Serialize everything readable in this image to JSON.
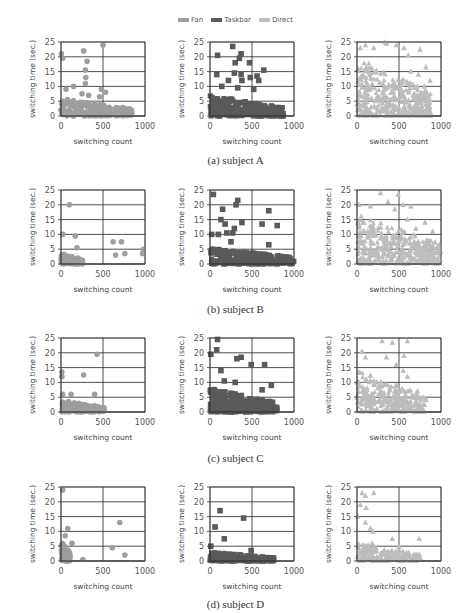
{
  "legend": [
    {
      "name": "Fan",
      "color": "#9e9e9e",
      "marker": "circle"
    },
    {
      "name": "Taskbar",
      "color": "#5a5a5a",
      "marker": "square"
    },
    {
      "name": "Direct",
      "color": "#bdbdbd",
      "marker": "triangle"
    }
  ],
  "captions": [
    "(a) subject A",
    "(b) subject B",
    "(c) subject C",
    "(d) subject D"
  ],
  "chart_data": [
    {
      "type": "scatter",
      "subject": "A",
      "series": "Fan",
      "marker": "circle",
      "color": "#9e9e9e",
      "xlabel": "switching count",
      "ylabel": "switching time (sec.)",
      "xlim": [
        0,
        1000
      ],
      "ylim": [
        0,
        25
      ],
      "xticks": [
        0,
        500,
        1000
      ],
      "yticks": [
        0,
        5,
        10,
        15,
        20,
        25
      ],
      "grid": true,
      "outliers": [
        [
          5,
          21
        ],
        [
          20,
          19.5
        ],
        [
          500,
          24
        ],
        [
          270,
          22
        ],
        [
          310,
          18.5
        ],
        [
          290,
          15.5
        ],
        [
          295,
          13
        ],
        [
          290,
          11
        ],
        [
          150,
          10
        ],
        [
          60,
          9
        ],
        [
          480,
          9
        ],
        [
          530,
          8
        ],
        [
          250,
          7.5
        ],
        [
          330,
          7
        ],
        [
          460,
          6.5
        ],
        [
          20,
          5
        ]
      ],
      "dense_region": {
        "x_range": [
          0,
          870
        ],
        "y_range": [
          0,
          6
        ]
      }
    },
    {
      "type": "scatter",
      "subject": "A",
      "series": "Taskbar",
      "marker": "square",
      "color": "#5a5a5a",
      "xlabel": "switching count",
      "ylabel": "switching time (sec.)",
      "xlim": [
        0,
        1000
      ],
      "ylim": [
        0,
        25
      ],
      "xticks": [
        0,
        500,
        1000
      ],
      "yticks": [
        0,
        5,
        10,
        15,
        20,
        25
      ],
      "grid": true,
      "outliers": [
        [
          270,
          23.5
        ],
        [
          90,
          20.5
        ],
        [
          370,
          21
        ],
        [
          350,
          19.5
        ],
        [
          300,
          18
        ],
        [
          470,
          18
        ],
        [
          640,
          15.5
        ],
        [
          80,
          14
        ],
        [
          290,
          14.5
        ],
        [
          370,
          14
        ],
        [
          560,
          13.5
        ],
        [
          480,
          13
        ],
        [
          380,
          12
        ],
        [
          580,
          12
        ],
        [
          220,
          12
        ],
        [
          330,
          9.5
        ],
        [
          520,
          9
        ],
        [
          140,
          10
        ]
      ],
      "dense_region": {
        "x_range": [
          0,
          880
        ],
        "y_range": [
          0,
          7
        ]
      }
    },
    {
      "type": "scatter",
      "subject": "A",
      "series": "Direct",
      "marker": "triangle",
      "color": "#bdbdbd",
      "xlabel": "switching count",
      "ylabel": "switching time (sec.)",
      "xlim": [
        0,
        1000
      ],
      "ylim": [
        0,
        25
      ],
      "xticks": [
        0,
        500,
        1000
      ],
      "yticks": [
        0,
        5,
        10,
        15,
        20,
        25
      ],
      "grid": true,
      "outliers": [
        [
          40,
          23
        ],
        [
          100,
          24
        ],
        [
          200,
          23
        ],
        [
          330,
          25
        ],
        [
          350,
          24.5
        ],
        [
          470,
          24
        ],
        [
          560,
          23
        ],
        [
          750,
          22.5
        ],
        [
          610,
          20.5
        ],
        [
          820,
          16.5
        ],
        [
          870,
          12
        ],
        [
          640,
          15
        ],
        [
          730,
          14
        ],
        [
          800,
          10
        ],
        [
          700,
          7
        ]
      ],
      "dense_region": {
        "x_range": [
          0,
          880
        ],
        "y_range": [
          0,
          20
        ]
      }
    },
    {
      "type": "scatter",
      "subject": "B",
      "series": "Fan",
      "marker": "circle",
      "color": "#9e9e9e",
      "xlabel": "switching count",
      "ylabel": "switching time (sec.)",
      "xlim": [
        0,
        1000
      ],
      "ylim": [
        0,
        25
      ],
      "xticks": [
        0,
        500,
        1000
      ],
      "yticks": [
        0,
        5,
        10,
        15,
        20,
        25
      ],
      "grid": true,
      "outliers": [
        [
          100,
          20
        ],
        [
          20,
          10
        ],
        [
          170,
          9.5
        ],
        [
          190,
          5.5
        ],
        [
          620,
          7.5
        ],
        [
          720,
          7.5
        ],
        [
          650,
          3
        ],
        [
          760,
          3.5
        ],
        [
          980,
          5
        ],
        [
          970,
          3.5
        ]
      ],
      "dense_region": {
        "x_range": [
          0,
          260
        ],
        "y_range": [
          0,
          4
        ]
      }
    },
    {
      "type": "scatter",
      "subject": "B",
      "series": "Taskbar",
      "marker": "square",
      "color": "#5a5a5a",
      "xlabel": "switching count",
      "ylabel": "switching time (sec.)",
      "xlim": [
        0,
        1000
      ],
      "ylim": [
        0,
        25
      ],
      "xticks": [
        0,
        500,
        1000
      ],
      "yticks": [
        0,
        5,
        10,
        15,
        20,
        25
      ],
      "grid": true,
      "outliers": [
        [
          40,
          23.5
        ],
        [
          330,
          21.5
        ],
        [
          310,
          20
        ],
        [
          150,
          18.5
        ],
        [
          700,
          18
        ],
        [
          130,
          15
        ],
        [
          180,
          13.5
        ],
        [
          380,
          14
        ],
        [
          620,
          13.5
        ],
        [
          800,
          13
        ],
        [
          290,
          12
        ],
        [
          270,
          10.5
        ],
        [
          20,
          10
        ],
        [
          100,
          10
        ],
        [
          200,
          10.5
        ],
        [
          250,
          7.5
        ],
        [
          700,
          6.5
        ]
      ],
      "dense_region": {
        "x_range": [
          0,
          1000
        ],
        "y_range": [
          0,
          5.5
        ]
      }
    },
    {
      "type": "scatter",
      "subject": "B",
      "series": "Direct",
      "marker": "triangle",
      "color": "#bdbdbd",
      "xlabel": "switching count",
      "ylabel": "switching time (sec.)",
      "xlim": [
        0,
        1000
      ],
      "ylim": [
        0,
        25
      ],
      "xticks": [
        0,
        500,
        1000
      ],
      "yticks": [
        0,
        5,
        10,
        15,
        20,
        25
      ],
      "grid": true,
      "outliers": [
        [
          280,
          24
        ],
        [
          490,
          23.5
        ],
        [
          20,
          20
        ],
        [
          160,
          19.5
        ],
        [
          370,
          21
        ],
        [
          550,
          20
        ],
        [
          640,
          19.5
        ],
        [
          450,
          18.5
        ],
        [
          810,
          14
        ],
        [
          900,
          11
        ],
        [
          960,
          6
        ],
        [
          700,
          12
        ],
        [
          600,
          15
        ]
      ],
      "dense_region": {
        "x_range": [
          0,
          1000
        ],
        "y_range": [
          0,
          17
        ]
      }
    },
    {
      "type": "scatter",
      "subject": "C",
      "series": "Fan",
      "marker": "circle",
      "color": "#9e9e9e",
      "xlabel": "switching count",
      "ylabel": "switching time (sec.)",
      "xlim": [
        0,
        1000
      ],
      "ylim": [
        0,
        25
      ],
      "xticks": [
        0,
        500,
        1000
      ],
      "yticks": [
        0,
        5,
        10,
        15,
        20,
        25
      ],
      "grid": true,
      "outliers": [
        [
          430,
          19.5
        ],
        [
          10,
          13.5
        ],
        [
          10,
          12
        ],
        [
          270,
          12.5
        ],
        [
          20,
          6
        ],
        [
          120,
          6
        ],
        [
          400,
          6
        ]
      ],
      "dense_region": {
        "x_range": [
          0,
          520
        ],
        "y_range": [
          0,
          4
        ]
      }
    },
    {
      "type": "scatter",
      "subject": "C",
      "series": "Taskbar",
      "marker": "square",
      "color": "#5a5a5a",
      "xlabel": "switching count",
      "ylabel": "switching time (sec.)",
      "xlim": [
        0,
        1000
      ],
      "ylim": [
        0,
        25
      ],
      "xticks": [
        0,
        500,
        1000
      ],
      "yticks": [
        0,
        5,
        10,
        15,
        20,
        25
      ],
      "grid": true,
      "outliers": [
        [
          90,
          24.5
        ],
        [
          80,
          21
        ],
        [
          10,
          19.5
        ],
        [
          320,
          18
        ],
        [
          370,
          18.5
        ],
        [
          490,
          16
        ],
        [
          650,
          16
        ],
        [
          130,
          14
        ],
        [
          170,
          10.5
        ],
        [
          300,
          10
        ],
        [
          730,
          9
        ],
        [
          620,
          7.5
        ]
      ],
      "dense_region": {
        "x_range": [
          0,
          800
        ],
        "y_range": [
          0,
          8
        ]
      }
    },
    {
      "type": "scatter",
      "subject": "C",
      "series": "Direct",
      "marker": "triangle",
      "color": "#bdbdbd",
      "xlabel": "switching count",
      "ylabel": "switching time (sec.)",
      "xlim": [
        0,
        1000
      ],
      "ylim": [
        0,
        25
      ],
      "xticks": [
        0,
        500,
        1000
      ],
      "yticks": [
        0,
        5,
        10,
        15,
        20,
        25
      ],
      "grid": true,
      "outliers": [
        [
          300,
          24
        ],
        [
          420,
          23.5
        ],
        [
          600,
          24
        ],
        [
          60,
          20.5
        ],
        [
          100,
          18.5
        ],
        [
          350,
          18.5
        ],
        [
          560,
          19
        ],
        [
          470,
          16
        ],
        [
          550,
          14
        ],
        [
          600,
          12
        ],
        [
          720,
          7
        ]
      ],
      "dense_region": {
        "x_range": [
          0,
          820
        ],
        "y_range": [
          0,
          14
        ]
      }
    },
    {
      "type": "scatter",
      "subject": "D",
      "series": "Fan",
      "marker": "circle",
      "color": "#9e9e9e",
      "xlabel": "switching count",
      "ylabel": "switching time (sec.)",
      "xlim": [
        0,
        1000
      ],
      "ylim": [
        0,
        25
      ],
      "xticks": [
        0,
        500,
        1000
      ],
      "yticks": [
        0,
        5,
        10,
        15,
        20,
        25
      ],
      "grid": true,
      "outliers": [
        [
          20,
          24
        ],
        [
          80,
          11
        ],
        [
          50,
          8.5
        ],
        [
          130,
          6
        ],
        [
          700,
          13
        ],
        [
          610,
          4.5
        ],
        [
          760,
          2
        ],
        [
          260,
          0.5
        ]
      ],
      "dense_region": {
        "x_range": [
          0,
          110
        ],
        "y_range": [
          0,
          7
        ]
      }
    },
    {
      "type": "scatter",
      "subject": "D",
      "series": "Taskbar",
      "marker": "square",
      "color": "#5a5a5a",
      "xlabel": "switching count",
      "ylabel": "switching time (sec.)",
      "xlim": [
        0,
        1000
      ],
      "ylim": [
        0,
        25
      ],
      "xticks": [
        0,
        500,
        1000
      ],
      "yticks": [
        0,
        5,
        10,
        15,
        20,
        25
      ],
      "grid": true,
      "outliers": [
        [
          120,
          17
        ],
        [
          400,
          14.5
        ],
        [
          60,
          11.5
        ],
        [
          170,
          7.5
        ],
        [
          10,
          5
        ],
        [
          490,
          3.5
        ]
      ],
      "dense_region": {
        "x_range": [
          0,
          760
        ],
        "y_range": [
          0,
          3
        ]
      }
    },
    {
      "type": "scatter",
      "subject": "D",
      "series": "Direct",
      "marker": "triangle",
      "color": "#bdbdbd",
      "xlabel": "switching count",
      "ylabel": "switching time (sec.)",
      "xlim": [
        0,
        1000
      ],
      "ylim": [
        0,
        25
      ],
      "xticks": [
        0,
        500,
        1000
      ],
      "yticks": [
        0,
        5,
        10,
        15,
        20,
        25
      ],
      "grid": true,
      "outliers": [
        [
          60,
          23
        ],
        [
          200,
          23
        ],
        [
          100,
          22
        ],
        [
          40,
          19
        ],
        [
          110,
          18
        ],
        [
          10,
          15
        ],
        [
          100,
          13
        ],
        [
          160,
          11
        ],
        [
          190,
          10
        ],
        [
          420,
          7.5
        ],
        [
          740,
          7.5
        ],
        [
          180,
          6
        ],
        [
          500,
          5
        ]
      ],
      "dense_region": {
        "x_range": [
          0,
          760
        ],
        "y_range": [
          0,
          6
        ]
      }
    }
  ]
}
